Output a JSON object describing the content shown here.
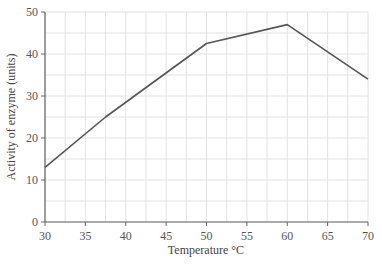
{
  "chart_data": {
    "type": "line",
    "title": "",
    "xlabel": "Temperature °C",
    "ylabel": "Activity of enzyme (units)",
    "xlim": [
      30,
      70
    ],
    "ylim": [
      0,
      50
    ],
    "x_ticks": [
      30,
      35,
      40,
      45,
      50,
      55,
      60,
      65,
      70
    ],
    "y_ticks": [
      0,
      10,
      20,
      30,
      40,
      50
    ],
    "grid": true,
    "grid_minor_x": 2.5,
    "grid_minor_y": 5,
    "legend": null,
    "series": [
      {
        "name": "Enzyme activity",
        "x": [
          30,
          37.5,
          50,
          60,
          70
        ],
        "values": [
          13,
          25,
          42.5,
          47,
          34
        ],
        "color": "#555555"
      }
    ]
  },
  "axes": {
    "x_title": "Temperature °C",
    "y_title": "Activity of enzyme (units)",
    "x_tick_labels": [
      "30",
      "35",
      "40",
      "45",
      "50",
      "55",
      "60",
      "65",
      "70"
    ],
    "y_tick_labels": [
      "0",
      "10",
      "20",
      "30",
      "40",
      "50"
    ]
  },
  "colors": {
    "grid": "#e2e2e2",
    "axis": "#666666",
    "line": "#555555",
    "text": "#555555"
  }
}
